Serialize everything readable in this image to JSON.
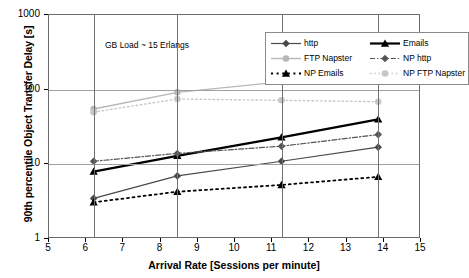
{
  "chart_data": {
    "type": "line",
    "title": "",
    "annotation": "GB Load ~ 15 Erlangs",
    "xlabel": "Arrival Rate  [Sessions per minute]",
    "ylabel": "90th percentile Object Transfer Delay [s]",
    "xscale": "linear",
    "yscale": "log",
    "xlim": [
      5,
      15
    ],
    "ylim": [
      1,
      1000
    ],
    "grid": true,
    "legend_position": "top-right-inside",
    "xticks": [
      5,
      6,
      7,
      8,
      9,
      10,
      11,
      12,
      13,
      14,
      15
    ],
    "xtick_labels": [
      "5",
      "6",
      "7",
      "8",
      "9",
      "10",
      "11",
      "12",
      "13",
      "14",
      "15"
    ],
    "yticks": [
      1,
      10,
      100,
      1000
    ],
    "ytick_labels": [
      "1",
      "10",
      "100",
      "1000"
    ],
    "x": [
      6.2,
      8.45,
      11.25,
      13.85
    ],
    "series": [
      {
        "name": "http",
        "values": [
          3.5,
          7.0,
          11.0,
          17.0
        ],
        "color": "#4a4a4a",
        "style": "solid",
        "marker": "diamond",
        "width": 1.2
      },
      {
        "name": "Emails",
        "values": [
          8.0,
          13.0,
          23.0,
          40.0
        ],
        "color": "#000000",
        "style": "solid",
        "marker": "triangle",
        "width": 2.2
      },
      {
        "name": "FTP Napster",
        "values": [
          55.0,
          92.0,
          127.0,
          135.0
        ],
        "color": "#b8b8b8",
        "style": "solid",
        "marker": "circle",
        "width": 1.4
      },
      {
        "name": "NP http",
        "values": [
          11.0,
          14.0,
          17.5,
          25.0
        ],
        "color": "#555555",
        "style": "dashdot",
        "marker": "diamond",
        "width": 1.2
      },
      {
        "name": "NP Emails",
        "values": [
          3.1,
          4.3,
          5.3,
          6.8
        ],
        "color": "#000000",
        "style": "dotted",
        "marker": "triangle",
        "width": 1.8
      },
      {
        "name": "NP FTP Napster",
        "values": [
          50.0,
          75.0,
          72.0,
          69.0
        ],
        "color": "#c6c6c6",
        "style": "dotted",
        "marker": "circle",
        "width": 1.4
      }
    ]
  },
  "legend": {
    "entries": [
      "http",
      "Emails",
      "FTP Napster",
      "NP http",
      "NP Emails",
      "NP FTP Napster"
    ]
  }
}
